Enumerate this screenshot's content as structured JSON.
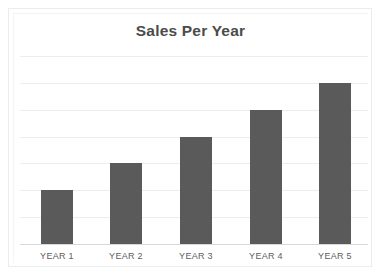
{
  "chart_data": {
    "type": "bar",
    "title": "Sales Per Year",
    "xlabel": "",
    "ylabel": "",
    "categories": [
      "YEAR 1",
      "YEAR 2",
      "YEAR 3",
      "YEAR 4",
      "YEAR 5"
    ],
    "values": [
      2,
      3,
      4,
      5,
      6
    ],
    "ylim": [
      0,
      7
    ],
    "yticks": [
      0,
      1,
      2,
      3,
      4,
      5,
      6,
      7
    ],
    "ytick_labels": [],
    "grid": true,
    "grid_axis": "y",
    "legend": false,
    "legend_position": "none",
    "annotations": [],
    "series": [
      {
        "name": "Sales",
        "values": [
          2,
          3,
          4,
          5,
          6
        ]
      }
    ]
  },
  "colors": {
    "bar_fill": "#5a5a5a",
    "gridline": "#ededed",
    "axis_line": "#d8d8d8",
    "title_text": "#4b4b4b",
    "label_text": "#5d5d5d",
    "frame_border": "#ececec",
    "background": "#ffffff"
  }
}
